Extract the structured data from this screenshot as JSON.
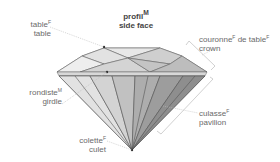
{
  "title": {
    "line1": "profil",
    "line1_gender": "M",
    "line2": "side face"
  },
  "labels": {
    "table": {
      "fr": "table",
      "gender": "F",
      "en": "table"
    },
    "crown": {
      "fr": "couronne",
      "gender": "F",
      "fr2": " de table",
      "gender2": "F",
      "en": "crown"
    },
    "girdle": {
      "fr": "rondiste",
      "gender": "M",
      "en": "girdle"
    },
    "culet": {
      "fr": "colette",
      "gender": "F",
      "en": "culet"
    },
    "pavilion": {
      "fr": "culasse",
      "gender": "F",
      "en": "pavilion"
    }
  },
  "colors": {
    "crown_light": "#e4e4e4",
    "crown_mid": "#cfcfcf",
    "pavilion_light": "#c9c9c9",
    "pavilion_dark": "#8e8e8e",
    "line": "#555555",
    "leader": "#bbbbbb"
  }
}
